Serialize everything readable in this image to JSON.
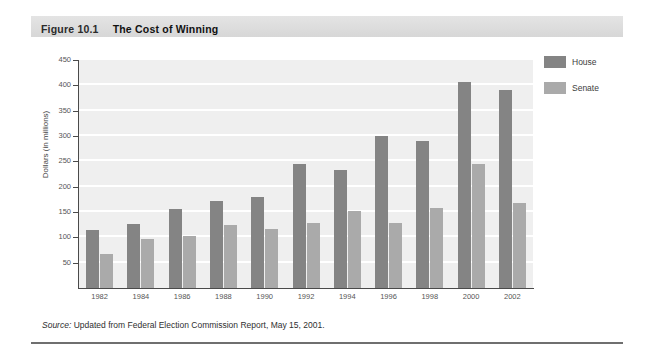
{
  "figure": {
    "number": "Figure 10.1",
    "title": "The Cost of Winning",
    "source_word": "Source:",
    "source_text": " Updated from Federal Election Commission Report, May 15, 2001."
  },
  "legend": {
    "house_label": "House",
    "senate_label": "Senate",
    "house_color": "#848484",
    "senate_color": "#aaaaaa"
  },
  "chart_data": {
    "type": "bar",
    "title": "The Cost of Winning",
    "xlabel": "",
    "ylabel": "Dollars (in millions)",
    "ylim": [
      0,
      450
    ],
    "yticks": [
      0,
      50,
      100,
      150,
      200,
      250,
      300,
      350,
      400,
      450
    ],
    "ytick_labels": [
      "",
      "50",
      "100",
      "150",
      "200",
      "250",
      "300",
      "350",
      "400",
      "450"
    ],
    "grid": true,
    "legend_position": "right",
    "categories": [
      "1982",
      "1984",
      "1986",
      "1988",
      "1990",
      "1992",
      "1994",
      "1996",
      "1998",
      "2000",
      "2002"
    ],
    "series": [
      {
        "name": "House",
        "color": "#848484",
        "values": [
          115,
          127,
          156,
          172,
          180,
          245,
          232,
          300,
          291,
          407,
          390
        ]
      },
      {
        "name": "Senate",
        "color": "#aaaaaa",
        "values": [
          68,
          97,
          103,
          124,
          116,
          128,
          152,
          129,
          157,
          245,
          168
        ]
      }
    ]
  }
}
